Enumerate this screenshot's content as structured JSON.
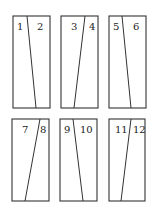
{
  "figure": {
    "stroke_color": "#333333",
    "background": "#ffffff",
    "panels": [
      {
        "left_label": "1",
        "right_label": "2"
      },
      {
        "left_label": "3",
        "right_label": "4"
      },
      {
        "left_label": "5",
        "right_label": "6"
      },
      {
        "left_label": "7",
        "right_label": "8"
      },
      {
        "left_label": "9",
        "right_label": "10"
      },
      {
        "left_label": "11",
        "right_label": "12"
      }
    ]
  }
}
